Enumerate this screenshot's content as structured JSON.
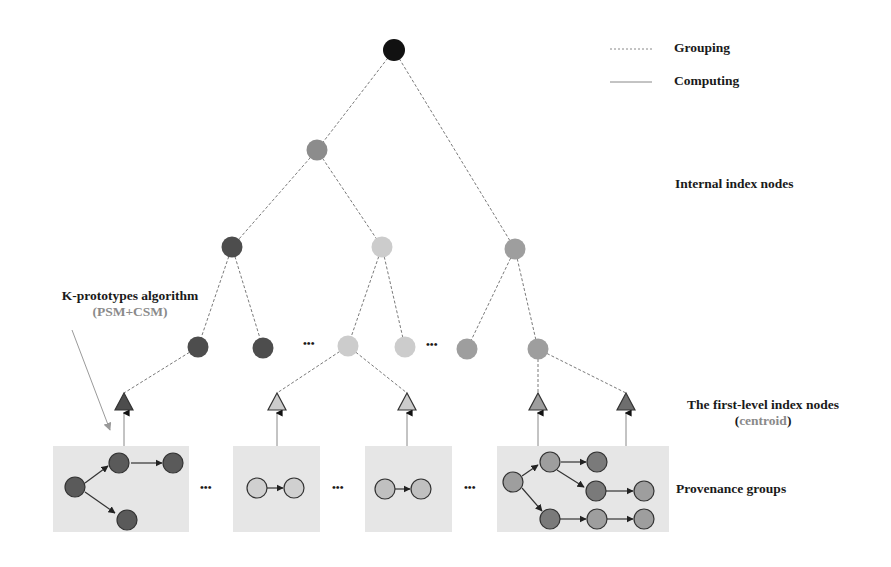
{
  "legend": {
    "items": [
      {
        "style": "dashed",
        "label": "Grouping"
      },
      {
        "style": "solid",
        "label": "Computing"
      }
    ]
  },
  "labels": {
    "internal_nodes": "Internal index nodes",
    "algorithm_title": "K-prototypes algorithm",
    "algorithm_sub": "(PSM+CSM)",
    "first_level_title": "The first-level index nodes",
    "first_level_sub_open": "(",
    "first_level_sub_word": "centroid",
    "first_level_sub_close": ")",
    "provenance_groups": "Provenance groups"
  },
  "ellipsis": "•••",
  "colors": {
    "root": "#111111",
    "level1": "#8c8c8c",
    "dark": "#4d4d4d",
    "light": "#cccccc",
    "mid": "#9e9e9e",
    "group_bg": "#e6e6e6",
    "edge": "#7a7a7a"
  },
  "tree": {
    "root": {
      "x": 394,
      "y": 50,
      "color": "root"
    },
    "nodes": [
      {
        "id": "L1",
        "x": 317,
        "y": 150,
        "color": "level1"
      },
      {
        "id": "L2a",
        "x": 232,
        "y": 247,
        "color": "dark"
      },
      {
        "id": "L2b",
        "x": 382,
        "y": 247,
        "color": "light"
      },
      {
        "id": "L2c",
        "x": 515,
        "y": 249,
        "color": "mid"
      },
      {
        "id": "L3a",
        "x": 198,
        "y": 347,
        "color": "dark"
      },
      {
        "id": "L3b",
        "x": 263,
        "y": 348,
        "color": "dark"
      },
      {
        "id": "L3c",
        "x": 348,
        "y": 346,
        "color": "light"
      },
      {
        "id": "L3d",
        "x": 405,
        "y": 347,
        "color": "light"
      },
      {
        "id": "L3e",
        "x": 467,
        "y": 349,
        "color": "mid"
      },
      {
        "id": "L3f",
        "x": 538,
        "y": 349,
        "color": "mid"
      }
    ],
    "first_level_centroids": [
      {
        "x": 124,
        "color": "dark"
      },
      {
        "x": 277,
        "color": "light"
      },
      {
        "x": 407,
        "color": "light"
      },
      {
        "x": 538,
        "color": "mid"
      },
      {
        "x": 626,
        "color": "dark"
      }
    ]
  }
}
